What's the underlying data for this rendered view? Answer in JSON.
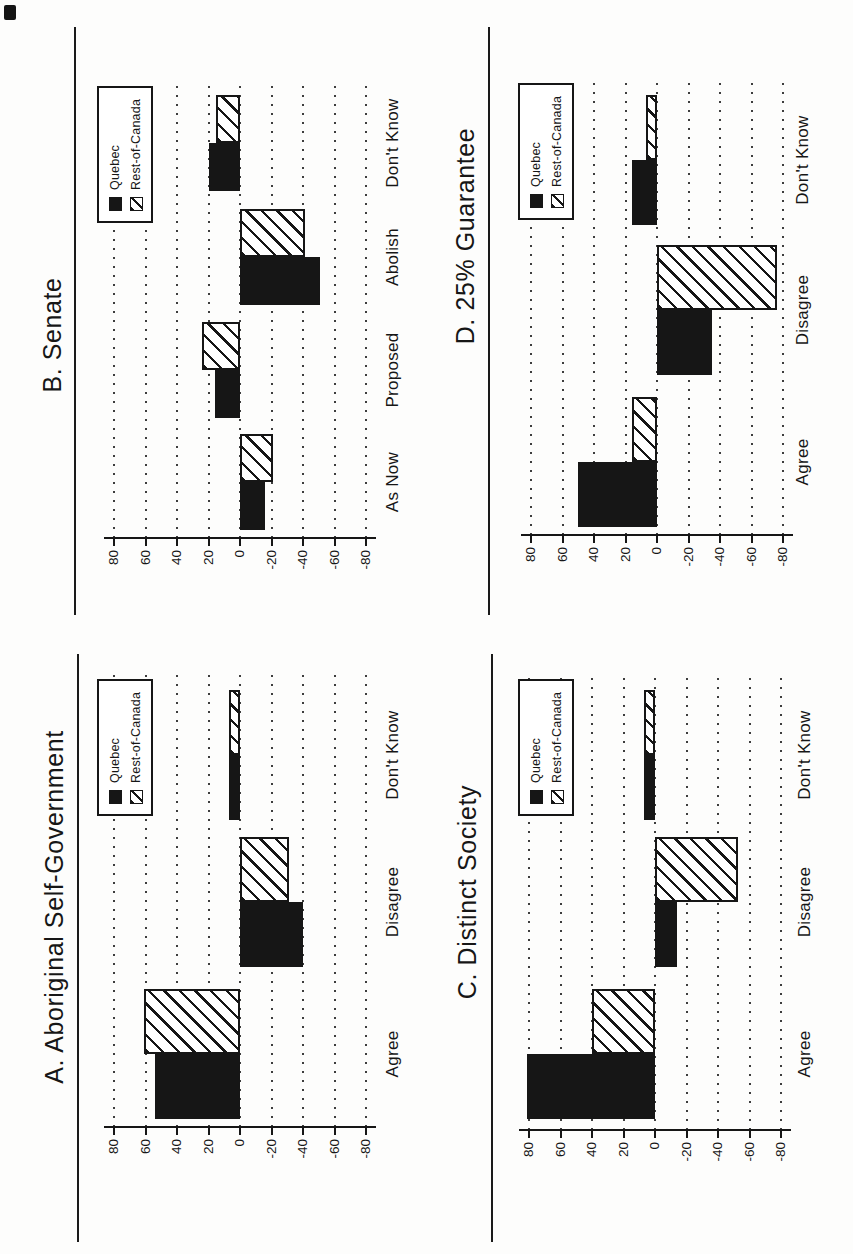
{
  "page": {
    "corner_artifact": "black-ink-mark"
  },
  "legend": {
    "items": [
      "Quebec",
      "Rest-of-Canada"
    ]
  },
  "chart_data": [
    {
      "id": "A",
      "type": "bar",
      "title": "A. Aboriginal Self-Government",
      "categories": [
        "Agree",
        "Disagree",
        "Don't Know"
      ],
      "series": [
        {
          "name": "Quebec",
          "values": [
            54,
            -40,
            7
          ]
        },
        {
          "name": "Rest-of-Canada",
          "values": [
            61,
            -31,
            7
          ]
        }
      ],
      "yticks": [
        80,
        60,
        40,
        20,
        0,
        -20,
        -40,
        -60,
        -80
      ],
      "ylim": [
        -80,
        80
      ],
      "grid": "dotted",
      "legend_position": "top-right"
    },
    {
      "id": "B",
      "type": "bar",
      "title": "B. Senate",
      "categories": [
        "As Now",
        "Proposed",
        "Abolish",
        "Don't Know"
      ],
      "series": [
        {
          "name": "Quebec",
          "values": [
            -16,
            16,
            -51,
            20
          ]
        },
        {
          "name": "Rest-of-Canada",
          "values": [
            -21,
            24,
            -41,
            15
          ]
        }
      ],
      "yticks": [
        80,
        60,
        40,
        20,
        0,
        -20,
        -40,
        -60,
        -80
      ],
      "ylim": [
        -80,
        80
      ],
      "grid": "dotted",
      "legend_position": "top-right"
    },
    {
      "id": "C",
      "type": "bar",
      "title": "C. Distinct Society",
      "categories": [
        "Agree",
        "Disagree",
        "Don't Know"
      ],
      "series": [
        {
          "name": "Quebec",
          "values": [
            81,
            -14,
            7
          ]
        },
        {
          "name": "Rest-of-Canada",
          "values": [
            40,
            -53,
            7
          ]
        }
      ],
      "yticks": [
        80,
        60,
        40,
        20,
        0,
        -20,
        -40,
        -60,
        -80
      ],
      "ylim": [
        -80,
        80
      ],
      "grid": "dotted",
      "legend_position": "top-right"
    },
    {
      "id": "D",
      "type": "bar",
      "title": "D. 25% Guarantee",
      "categories": [
        "Agree",
        "Disagree",
        "Don't Know"
      ],
      "series": [
        {
          "name": "Quebec",
          "values": [
            50,
            -35,
            16
          ]
        },
        {
          "name": "Rest-of-Canada",
          "values": [
            16,
            -76,
            7
          ]
        }
      ],
      "yticks": [
        80,
        60,
        40,
        20,
        0,
        -20,
        -40,
        -60,
        -80
      ],
      "ylim": [
        -80,
        80
      ],
      "grid": "dotted",
      "legend_position": "top-right"
    }
  ]
}
